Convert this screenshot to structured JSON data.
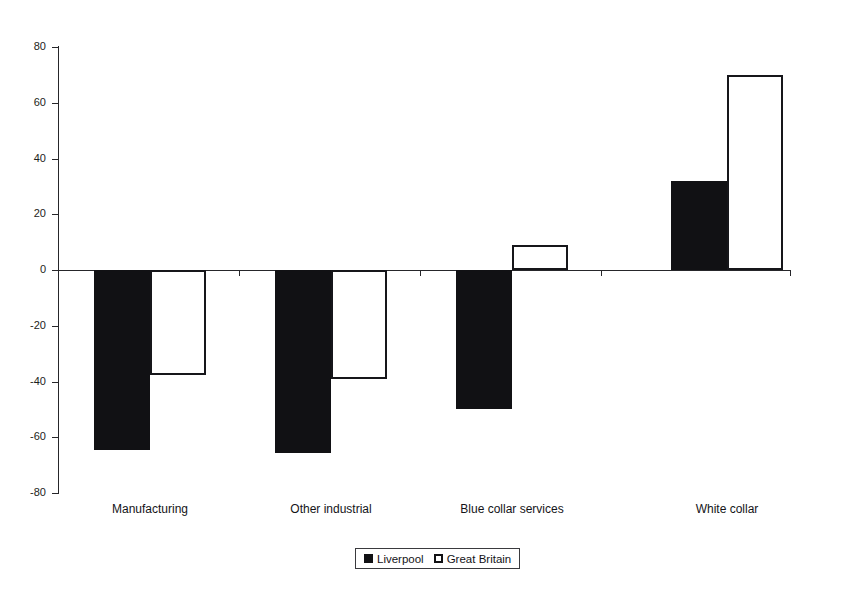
{
  "figure": {
    "clipped_title": "",
    "background_color": "#ffffff"
  },
  "chart_data": {
    "type": "bar",
    "title": "",
    "subtitle": "",
    "xlabel": "",
    "ylabel": "",
    "categories": [
      "Manufacturing",
      "Other industrial",
      "Blue collar services",
      "White collar"
    ],
    "series": [
      {
        "name": "Liverpool",
        "color": "#111114",
        "fill": "solid-black",
        "values": [
          -64.5,
          -65.5,
          -50.0,
          32.0
        ]
      },
      {
        "name": "Great Britain",
        "color": "#ffffff",
        "fill": "white-with-black-outline",
        "values": [
          -37.5,
          -39.0,
          9.0,
          70.0
        ]
      }
    ],
    "ylim": [
      -80,
      80
    ],
    "yticks": [
      80,
      60,
      40,
      20,
      0,
      -20,
      -40,
      -60,
      -80
    ],
    "ytick_labels": [
      "80",
      "60",
      "40",
      "20",
      "0",
      "-20",
      "-40",
      "-60",
      "-80"
    ],
    "grid": false,
    "legend_position": "bottom-center",
    "legend_entries": [
      "Liverpool",
      "Great Britain"
    ],
    "zero_baseline": true,
    "orientation": "vertical"
  },
  "axis": {
    "y_ticks": [
      {
        "label": "80",
        "value": 80
      },
      {
        "label": "60",
        "value": 60
      },
      {
        "label": "40",
        "value": 40
      },
      {
        "label": "20",
        "value": 20
      },
      {
        "label": "0",
        "value": 0
      },
      {
        "label": "-20",
        "value": -20
      },
      {
        "label": "-40",
        "value": -40
      },
      {
        "label": "-60",
        "value": -60
      },
      {
        "label": "-80",
        "value": -80
      }
    ]
  },
  "legend": {
    "items": [
      {
        "label": "Liverpool",
        "swatch": "filled-square-black"
      },
      {
        "label": "Great Britain",
        "swatch": "outlined-square-white"
      }
    ]
  }
}
